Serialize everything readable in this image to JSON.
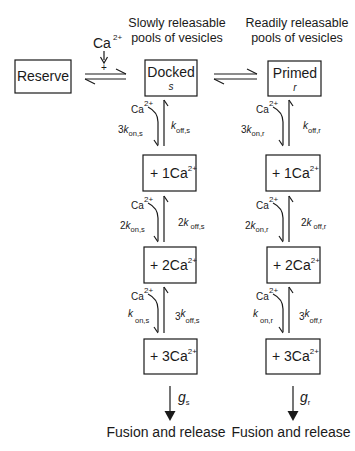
{
  "header": {
    "slow_pool_line1": "Slowly releasable",
    "slow_pool_line2": "pools of vesicles",
    "ready_pool_line1": "Readily releasable",
    "ready_pool_line2": "pools of vesicles"
  },
  "calcium_input": {
    "ion": "Ca",
    "charge": "2+",
    "sign": "+"
  },
  "boxes": {
    "reserve": "Reserve",
    "docked": {
      "label": "Docked",
      "symbol": "s"
    },
    "primed": {
      "label": "Primed",
      "symbol": "r"
    }
  },
  "columns": [
    {
      "id": "slow",
      "states": [
        {
          "prefix": "+ 1Ca",
          "sup": "2+"
        },
        {
          "prefix": "+ 2Ca",
          "sup": "2+"
        },
        {
          "prefix": "+ 3Ca",
          "sup": "2+"
        }
      ],
      "transitions": [
        {
          "ca": "Ca",
          "ca_sup": "2+",
          "on_coef": "3",
          "on_k": "k",
          "on_sub": "on,s",
          "off_coef": "",
          "off_k": "k",
          "off_sub": "off,s"
        },
        {
          "ca": "Ca",
          "ca_sup": "2+",
          "on_coef": "2",
          "on_k": "k",
          "on_sub": "on,s",
          "off_coef": "2",
          "off_k": "k",
          "off_sub": "off,s"
        },
        {
          "ca": "Ca",
          "ca_sup": "2+",
          "on_coef": "",
          "on_k": "k",
          "on_sub": "on,s",
          "off_coef": "3",
          "off_k": "k",
          "off_sub": "off,s"
        }
      ],
      "release_rate": {
        "g": "g",
        "sub": "s"
      },
      "outcome": "Fusion and release"
    },
    {
      "id": "ready",
      "states": [
        {
          "prefix": "+ 1Ca",
          "sup": "2+"
        },
        {
          "prefix": "+ 2Ca",
          "sup": "2+"
        },
        {
          "prefix": "+ 3Ca",
          "sup": "2+"
        }
      ],
      "transitions": [
        {
          "ca": "Ca",
          "ca_sup": "2+",
          "on_coef": "3",
          "on_k": "k",
          "on_sub": "on,r",
          "off_coef": "",
          "off_k": "k",
          "off_sub": "off,r"
        },
        {
          "ca": "Ca",
          "ca_sup": "2+",
          "on_coef": "2",
          "on_k": "k",
          "on_sub": "on,r",
          "off_coef": "2",
          "off_k": "k",
          "off_sub": "off,r"
        },
        {
          "ca": "Ca",
          "ca_sup": "2+",
          "on_coef": "",
          "on_k": "k",
          "on_sub": "on,r",
          "off_coef": "3",
          "off_k": "k",
          "off_sub": "off,r"
        }
      ],
      "release_rate": {
        "g": "g",
        "sub": "r"
      },
      "outcome": "Fusion and release"
    }
  ],
  "colors": {
    "ink": "#1a1a1a",
    "background": "#ffffff"
  }
}
